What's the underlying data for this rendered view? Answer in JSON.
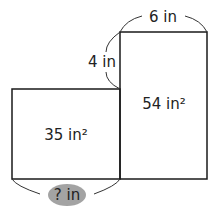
{
  "diagram": {
    "type": "area-model",
    "left_rectangle": {
      "area_label": "35 in²",
      "width_label": "? in"
    },
    "right_rectangle": {
      "area_label": "54 in²",
      "width_label": "6 in"
    },
    "step_label": "4 in",
    "colors": {
      "stroke": "#1a1a1a",
      "unknown_oval": "#a3a3a3",
      "text": "#222222"
    }
  }
}
